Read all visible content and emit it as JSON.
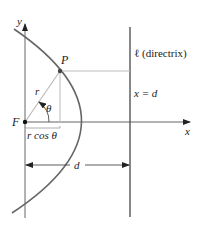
{
  "diagram": {
    "labels": {
      "y_axis": "y",
      "x_axis": "x",
      "point_p": "P",
      "focus": "F",
      "radius": "r",
      "angle": "θ",
      "projection": "r cos θ",
      "distance": "d",
      "directrix": "ℓ (directrix)",
      "directrix_eq": "x = d"
    },
    "colors": {
      "axis": "#333333",
      "curve": "#666666",
      "guide": "#bbbbbb",
      "directrix": "#555555",
      "point": "#444444"
    }
  }
}
